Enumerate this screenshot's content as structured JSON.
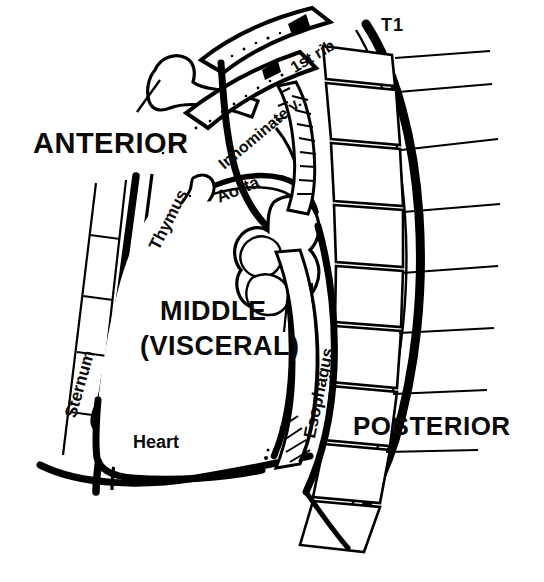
{
  "figure": {
    "kind": "anatomical-line-drawing",
    "view": "lateral sagittal chest / mediastinum",
    "background_color": "#ffffff",
    "ink_color": "#000000"
  },
  "compartment_labels": {
    "anterior": "ANTERIOR",
    "middle_line1": "MIDDLE",
    "middle_line2": "(VISCERAL)",
    "posterior": "POSTERIOR"
  },
  "structure_labels": {
    "sternum": "Sternum",
    "thymus": "Thymus",
    "heart": "Heart",
    "aorta": "Aorta",
    "innominate_vein": "Innominate v.",
    "first_rib": "1st rib",
    "t1_vertebra": "T1",
    "esophagus": "Esophagus"
  }
}
